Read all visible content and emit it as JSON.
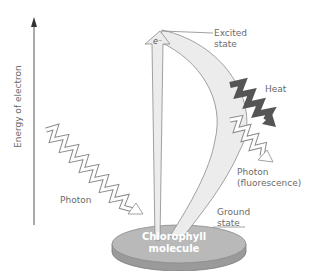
{
  "diagram": {
    "axis_label": "Energy of electron",
    "labels": {
      "excited_state": [
        "Excited",
        "state"
      ],
      "ground_state": [
        "Ground",
        "state"
      ],
      "heat": "Heat",
      "photon_in": "Photon",
      "photon_out": [
        "Photon",
        "(fluorescence)"
      ],
      "electron": "e⁻",
      "molecule": [
        "Chlorophyll",
        "molecule"
      ]
    },
    "colors": {
      "text": "#6a6a6a",
      "disc_top": "#b9b9b9",
      "disc_side": "#9a9a9a",
      "arrow_fill": "#ececec",
      "heat_fill": "#555555",
      "outline": "#8a8a8a"
    }
  }
}
